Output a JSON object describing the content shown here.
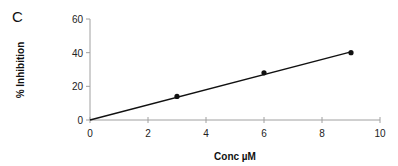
{
  "panel_label": "C",
  "chart_data": {
    "type": "scatter",
    "title": "",
    "xlabel": "Conc µM",
    "ylabel": "% Inhibition",
    "xlim": [
      0,
      10
    ],
    "ylim": [
      0,
      60
    ],
    "x_ticks": [
      0,
      2,
      4,
      6,
      8,
      10
    ],
    "y_ticks": [
      0,
      20,
      40,
      60
    ],
    "grid": false,
    "legend": null,
    "series": [
      {
        "name": "data",
        "marker": "filled-circle",
        "x": [
          3,
          6,
          9
        ],
        "y": [
          14,
          28,
          40
        ]
      },
      {
        "name": "linear fit",
        "type": "line",
        "x": [
          0,
          9
        ],
        "y": [
          0,
          40.5
        ]
      }
    ],
    "colors": {
      "axis": "#a0a0a0",
      "line": "#111111",
      "marker": "#111111"
    }
  }
}
